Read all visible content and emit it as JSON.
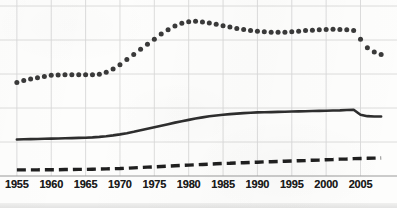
{
  "chart_data": {
    "type": "line",
    "title": "",
    "subtitle": "",
    "xlabel": "",
    "ylabel": "",
    "xlim": [
      1954,
      2009
    ],
    "ylim": [
      0,
      100
    ],
    "grid": true,
    "grid_x_values": [
      1955,
      1960,
      1965,
      1970,
      1975,
      1980,
      1985,
      1990,
      1995,
      2000,
      2005
    ],
    "grid_y_values": [
      0,
      20,
      40,
      60,
      80,
      100
    ],
    "legend": "none",
    "legend_position": "none",
    "annotations": [],
    "xticks": [
      "1955",
      "1960",
      "1965",
      "1970",
      "1975",
      "1980",
      "1985",
      "1990",
      "1995",
      "2000",
      "2005"
    ],
    "yticks": [],
    "x": [
      1955,
      1956,
      1957,
      1958,
      1959,
      1960,
      1961,
      1962,
      1963,
      1964,
      1965,
      1966,
      1967,
      1968,
      1969,
      1970,
      1971,
      1972,
      1973,
      1974,
      1975,
      1976,
      1977,
      1978,
      1979,
      1980,
      1981,
      1982,
      1983,
      1984,
      1985,
      1986,
      1987,
      1988,
      1989,
      1990,
      1991,
      1992,
      1993,
      1994,
      1995,
      1996,
      1997,
      1998,
      1999,
      2000,
      2001,
      2002,
      2003,
      2004,
      2005,
      2006,
      2007,
      2008
    ],
    "series": [
      {
        "name": "dotted-series",
        "style": "dotted",
        "color": "#3a3a3a",
        "marker": "circle",
        "values": [
          55.0,
          56.2,
          57.0,
          57.8,
          58.6,
          59.2,
          59.4,
          59.5,
          59.6,
          59.6,
          59.6,
          59.5,
          59.8,
          61.0,
          63.0,
          65.5,
          68.5,
          71.5,
          74.5,
          77.5,
          80.5,
          83.5,
          86.0,
          88.2,
          89.8,
          90.8,
          91.0,
          90.6,
          90.0,
          89.2,
          88.4,
          87.6,
          86.8,
          86.2,
          85.6,
          85.2,
          84.8,
          84.6,
          84.5,
          84.6,
          84.8,
          85.2,
          85.6,
          85.8,
          86.0,
          86.2,
          86.3,
          86.2,
          86.0,
          85.6,
          80.5,
          75.5,
          73.0,
          71.5
        ]
      },
      {
        "name": "solid-series",
        "style": "solid",
        "color": "#2e2e2e",
        "marker": "none",
        "values": [
          21.5,
          21.6,
          21.7,
          21.8,
          21.9,
          22.0,
          22.1,
          22.2,
          22.3,
          22.4,
          22.5,
          22.7,
          23.0,
          23.4,
          23.9,
          24.5,
          25.2,
          26.0,
          26.9,
          27.8,
          28.7,
          29.6,
          30.5,
          31.4,
          32.2,
          33.0,
          33.8,
          34.5,
          35.1,
          35.6,
          36.0,
          36.4,
          36.7,
          37.0,
          37.2,
          37.4,
          37.5,
          37.6,
          37.7,
          37.8,
          37.9,
          38.0,
          38.1,
          38.2,
          38.3,
          38.4,
          38.5,
          38.6,
          38.8,
          39.0,
          36.0,
          35.2,
          35.0,
          35.0
        ]
      },
      {
        "name": "dashed-series",
        "style": "dashed",
        "color": "#1f1f1f",
        "marker": "none",
        "values": [
          3.6,
          3.6,
          3.6,
          3.6,
          3.7,
          3.7,
          3.7,
          3.8,
          3.8,
          3.9,
          3.9,
          4.0,
          4.1,
          4.2,
          4.3,
          4.4,
          4.6,
          4.8,
          5.0,
          5.2,
          5.4,
          5.6,
          5.8,
          6.0,
          6.2,
          6.4,
          6.6,
          6.8,
          7.0,
          7.2,
          7.4,
          7.5,
          7.7,
          7.8,
          8.0,
          8.1,
          8.3,
          8.4,
          8.5,
          8.7,
          8.8,
          9.0,
          9.1,
          9.3,
          9.4,
          9.6,
          9.7,
          9.9,
          10.0,
          10.2,
          10.3,
          10.4,
          10.5,
          10.6
        ]
      }
    ],
    "colors": {
      "grid": "#d8d8d8",
      "axis": "#9a9a9a",
      "background": "#fdfdfc",
      "ink": "#1f1f1f"
    }
  }
}
